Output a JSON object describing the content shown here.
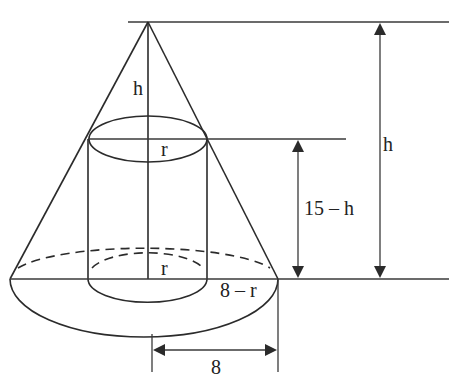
{
  "diagram": {
    "labels": {
      "cone_upper_height": "h",
      "cylinder_top_radius": "r",
      "cylinder_bottom_radius": "r",
      "remainder_radius": "8 – r",
      "cylinder_height": "15 – h",
      "total_height": "h",
      "base_radius": "8"
    },
    "colors": {
      "line": "#2b2b2b",
      "background": "#ffffff"
    }
  }
}
